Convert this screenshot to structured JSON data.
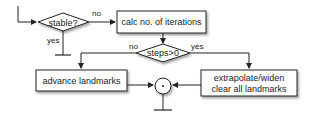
{
  "diagram": {
    "nodes": {
      "stable": {
        "label": "stable?",
        "shape": "diamond"
      },
      "calc": {
        "label": "calc no. of iterations",
        "shape": "box"
      },
      "steps": {
        "label": "steps>0",
        "shape": "diamond"
      },
      "advance": {
        "label": "advance landmarks",
        "shape": "box"
      },
      "extrapolate": {
        "line1": "extrapolate/widen",
        "line2": "clear all landmarks",
        "shape": "box"
      },
      "join": {
        "label": "•",
        "shape": "circle"
      }
    },
    "edges": {
      "stable_no": "no",
      "stable_yes": "yes",
      "steps_no": "no",
      "steps_yes": "yes"
    }
  }
}
